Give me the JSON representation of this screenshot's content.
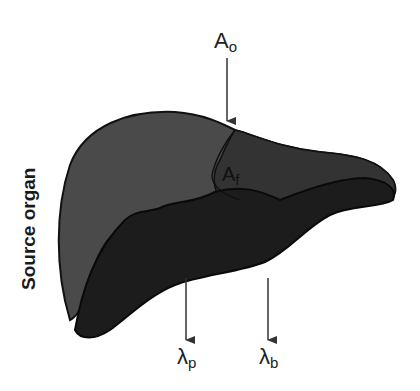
{
  "diagram": {
    "axis_label": "Source organ",
    "labels": {
      "a_o": {
        "base": "A",
        "sub": "o"
      },
      "a_f": {
        "base": "A",
        "sub": "f"
      },
      "lambda_p": {
        "base": "λ",
        "sub": "p"
      },
      "lambda_b": {
        "base": "λ",
        "sub": "b"
      }
    },
    "colors": {
      "upper_lobe": "#4a4a4a",
      "lower_lobe": "#1c1c1c",
      "right_lobe": "#2e2e2e",
      "outline": "#111111",
      "arrow": "#333333"
    }
  }
}
